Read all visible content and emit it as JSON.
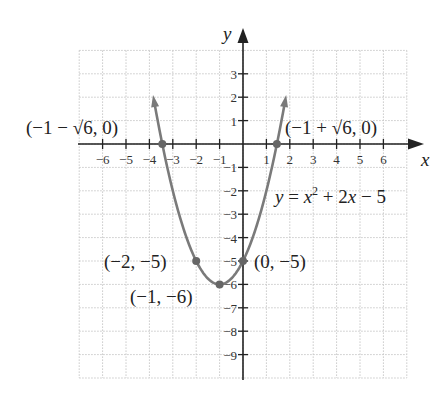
{
  "chart_data": {
    "type": "line",
    "title": "",
    "equation": "y = x^2 + 2x - 5",
    "xlabel": "x",
    "ylabel": "y",
    "xlim": [
      -7,
      7
    ],
    "ylim": [
      -10,
      4
    ],
    "grid": true,
    "x_ticks": [
      -6,
      -5,
      -4,
      -3,
      -2,
      -1,
      1,
      2,
      3,
      4,
      5,
      6
    ],
    "x_tick_labels": [
      "−6",
      "−5",
      "−4",
      "−3",
      "−2",
      "−1",
      "1",
      "2",
      "3",
      "4",
      "5",
      "6"
    ],
    "y_ticks": [
      3,
      2,
      1,
      -1,
      -2,
      -3,
      -4,
      -5,
      -6,
      -7,
      -8,
      -9
    ],
    "y_tick_labels": [
      "3",
      "2",
      "1",
      "−1",
      "−2",
      "−3",
      "−4",
      "−5",
      "−6",
      "−7",
      "−8",
      "−9"
    ],
    "series": [
      {
        "name": "y = x^2 + 2x - 5",
        "function": "x^2 + 2x - 5",
        "x_range": [
          -3.8,
          1.8
        ],
        "color": "#7a7a7a"
      }
    ],
    "points": [
      {
        "x": -3.449,
        "y": 0,
        "label": "(−1 − √6, 0)"
      },
      {
        "x": 1.449,
        "y": 0,
        "label": "(−1 + √6, 0)"
      },
      {
        "x": -2,
        "y": -5,
        "label": "(−2, −5)"
      },
      {
        "x": -1,
        "y": -6,
        "label": "(−1, −6)"
      },
      {
        "x": 0,
        "y": -5,
        "label": "(0, −5)"
      }
    ]
  },
  "labels": {
    "x_axis": "x",
    "y_axis": "y",
    "equation_y": "y",
    "equation_rest_1": " = ",
    "equation_x": "x",
    "equation_exp": "2",
    "equation_rest_2": " + 2",
    "equation_x2": "x",
    "equation_rest_3": " − 5",
    "root_left": "(−1 − √6, 0)",
    "root_right": "(−1 + √6, 0)",
    "point_m2": "(−2, −5)",
    "vertex": "(−1, −6)",
    "y_intercept": "(0, −5)"
  },
  "colors": {
    "curve": "#7a7a7a",
    "point": "#666666",
    "axis": "#222222",
    "grid": "#c8c8c8"
  }
}
